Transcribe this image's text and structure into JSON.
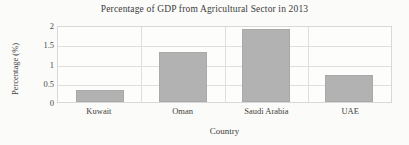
{
  "chart_data": {
    "type": "bar",
    "title": "Percentage of GDP from Agricultural Sector in 2013",
    "categories": [
      "Kuwait",
      "Oman",
      "Saudi Arabia",
      "UAE"
    ],
    "values": [
      0.3,
      1.3,
      1.9,
      0.7
    ],
    "xlabel": "Country",
    "ylabel": "Percentage (%)",
    "ylim": [
      0,
      2
    ],
    "yticks": [
      "0",
      "0.5",
      "1",
      "1.5",
      "2"
    ],
    "ytick_values": [
      0,
      0.5,
      1,
      1.5,
      2
    ],
    "grid": true,
    "legend": false,
    "bar_color": "#b2b2b2",
    "background_color": "#fbfbf9",
    "grid_color": "#dededc",
    "text_color": "#3c3c3c"
  }
}
